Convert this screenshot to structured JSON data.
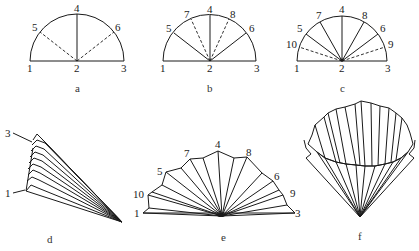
{
  "figure": {
    "panels": [
      {
        "id": "a",
        "caption": "a",
        "point_labels": [
          "1",
          "2",
          "3",
          "4",
          "5",
          "6"
        ],
        "solid_folds": [
          "2-4"
        ],
        "dashed_folds": [
          "2-5",
          "2-6"
        ]
      },
      {
        "id": "b",
        "caption": "b",
        "point_labels": [
          "1",
          "2",
          "3",
          "4",
          "5",
          "6",
          "7",
          "8"
        ],
        "solid_folds": [
          "2-4",
          "2-5",
          "2-6"
        ],
        "dashed_folds": [
          "2-7",
          "2-8"
        ]
      },
      {
        "id": "c",
        "caption": "c",
        "point_labels": [
          "1",
          "2",
          "3",
          "4",
          "5",
          "6",
          "7",
          "8",
          "9",
          "10"
        ],
        "solid_folds": [
          "2-4",
          "2-5",
          "2-6",
          "2-7",
          "2-8"
        ],
        "dashed_folds": [
          "2-9",
          "2-10"
        ]
      },
      {
        "id": "d",
        "caption": "d",
        "point_labels": [
          "3",
          "1"
        ],
        "description": "fully pleated, collapsed fan"
      },
      {
        "id": "e",
        "caption": "e",
        "point_labels": [
          "1",
          "10",
          "5",
          "7",
          "4",
          "8",
          "6",
          "9",
          "3"
        ],
        "description": "pleated fan opened"
      },
      {
        "id": "f",
        "caption": "f",
        "point_labels": [],
        "description": "pleated cone"
      }
    ]
  },
  "labels": {
    "a": {
      "p1": "1",
      "p2": "2",
      "p3": "3",
      "p4": "4",
      "p5": "5",
      "p6": "6",
      "cap": "a"
    },
    "b": {
      "p1": "1",
      "p2": "2",
      "p3": "3",
      "p4": "4",
      "p5": "5",
      "p6": "6",
      "p7": "7",
      "p8": "8",
      "cap": "b"
    },
    "c": {
      "p1": "1",
      "p2": "2",
      "p3": "3",
      "p4": "4",
      "p5": "5",
      "p6": "6",
      "p7": "7",
      "p8": "8",
      "p9": "9",
      "p10": "10",
      "cap": "c"
    },
    "d": {
      "p3": "3",
      "p1": "1",
      "cap": "d"
    },
    "e": {
      "p1": "1",
      "p10": "10",
      "p5": "5",
      "p7": "7",
      "p4": "4",
      "p8": "8",
      "p6": "6",
      "p9": "9",
      "p3": "3",
      "cap": "e"
    },
    "f": {
      "cap": "f"
    }
  }
}
